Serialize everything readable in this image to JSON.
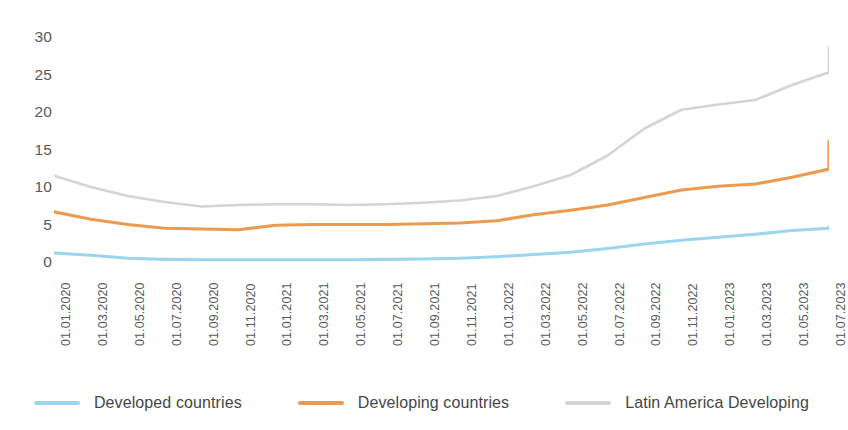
{
  "chart_data": {
    "type": "line",
    "title": "",
    "xlabel": "",
    "ylabel": "",
    "ylim": [
      0,
      30
    ],
    "yticks": [
      0,
      5,
      10,
      15,
      20,
      25,
      30
    ],
    "grid": false,
    "legend_position": "bottom",
    "categories": [
      "01.01.2020",
      "01.03.2020",
      "01.05.2020",
      "01.07.2020",
      "01.09.2020",
      "01.11.2020",
      "01.01.2021",
      "01.03.2021",
      "01.05.2021",
      "01.07.2021",
      "01.09.2021",
      "01.11.2021",
      "01.01.2022",
      "01.03.2022",
      "01.05.2022",
      "01.07.2022",
      "01.09.2022",
      "01.11.2022",
      "01.01.2023",
      "01.03.2023",
      "01.05.2023",
      "01.07.2023"
    ],
    "series": [
      {
        "name": "Developed countries",
        "color": "#9DD5EF",
        "values": [
          1.2,
          0.9,
          0.5,
          0.35,
          0.3,
          0.3,
          0.3,
          0.3,
          0.3,
          0.35,
          0.4,
          0.5,
          0.7,
          1.0,
          1.3,
          1.8,
          2.4,
          2.9,
          3.3,
          3.7,
          4.2,
          4.5
        ]
      },
      {
        "name": "Developing countries",
        "color": "#ED9A51",
        "values": [
          6.7,
          5.7,
          5.0,
          4.5,
          4.4,
          4.3,
          4.9,
          5.0,
          5.0,
          5.0,
          5.1,
          5.2,
          5.5,
          6.3,
          6.9,
          7.6,
          8.6,
          9.6,
          10.1,
          10.4,
          11.3,
          12.4
        ]
      },
      {
        "name": "Latin America Developing",
        "color": "#D3D4D6",
        "values": [
          11.5,
          10.0,
          8.8,
          8.0,
          7.4,
          7.6,
          7.7,
          7.7,
          7.6,
          7.7,
          7.9,
          8.2,
          8.8,
          10.1,
          11.6,
          14.2,
          17.8,
          20.3,
          21.0,
          21.6,
          23.6,
          25.3
        ]
      }
    ],
    "series_endpoints": [
      {
        "name": "Developed countries",
        "value": 4.7
      },
      {
        "name": "Developing countries",
        "value": 16.1
      },
      {
        "name": "Latin America Developing",
        "value": 28.6
      }
    ]
  },
  "y_axis": {
    "ticks": [
      "30",
      "25",
      "20",
      "15",
      "10",
      "5",
      "0"
    ]
  },
  "x_axis": {
    "ticks": [
      "01.01.2020",
      "01.03.2020",
      "01.05.2020",
      "01.07.2020",
      "01.09.2020",
      "01.11.2020",
      "01.01.2021",
      "01.03.2021",
      "01.05.2021",
      "01.07.2021",
      "01.09.2021",
      "01.11.2021",
      "01.01.2022",
      "01.03.2022",
      "01.05.2022",
      "01.07.2022",
      "01.09.2022",
      "01.11.2022",
      "01.01.2023",
      "01.03.2023",
      "01.05.2023",
      "01.07.2023"
    ]
  },
  "legend": {
    "items": [
      {
        "label": "Developed countries",
        "color": "#9DD5EF"
      },
      {
        "label": "Developing countries",
        "color": "#ED9A51"
      },
      {
        "label": "Latin America Developing",
        "color": "#D3D4D6"
      }
    ]
  }
}
